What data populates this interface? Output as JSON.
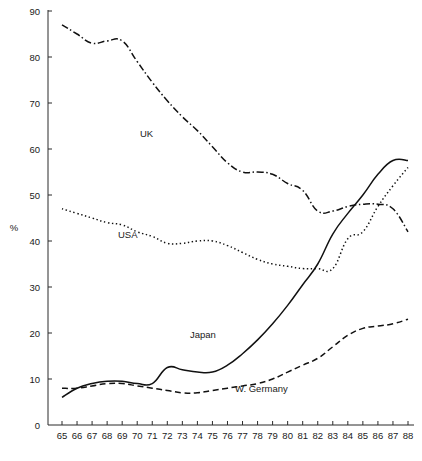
{
  "chart_data": {
    "type": "line",
    "title": "",
    "xlabel": "",
    "ylabel": "%",
    "xlim": [
      65,
      88
    ],
    "ylim": [
      0,
      90
    ],
    "grid": false,
    "legend": "inline-annotations",
    "x": [
      65,
      66,
      67,
      68,
      69,
      70,
      71,
      72,
      73,
      74,
      75,
      76,
      77,
      78,
      79,
      80,
      81,
      82,
      83,
      84,
      85,
      86,
      87,
      88
    ],
    "xticklabels": [
      "65",
      "66",
      "67",
      "68",
      "69",
      "70",
      "71",
      "72",
      "73",
      "74",
      "75",
      "76",
      "77",
      "78",
      "79",
      "80",
      "81",
      "82",
      "83",
      "84",
      "85",
      "86",
      "87",
      "88"
    ],
    "yticklabels": [
      "0",
      "10",
      "20",
      "30",
      "40",
      "50",
      "60",
      "70",
      "80",
      "90"
    ],
    "yticks": [
      0,
      10,
      20,
      30,
      40,
      50,
      60,
      70,
      80,
      90
    ],
    "series": [
      {
        "name": "UK",
        "style": "dash-dot",
        "label": "UK",
        "values": [
          87,
          85,
          83,
          83.5,
          83.5,
          79,
          74.5,
          70.5,
          67,
          64,
          60.5,
          57,
          55,
          55,
          54.5,
          52.5,
          51,
          46.5,
          46.5,
          47.5,
          48,
          48,
          47,
          42
        ]
      },
      {
        "name": "USA",
        "style": "dotted",
        "label": "USA",
        "values": [
          47,
          46,
          45,
          44,
          43.5,
          42,
          41,
          39.5,
          39.5,
          40,
          40,
          39,
          37.5,
          36,
          35,
          34.5,
          34,
          34,
          34,
          40.5,
          42,
          47.5,
          52,
          56
        ]
      },
      {
        "name": "Japan",
        "style": "solid",
        "label": "Japan",
        "values": [
          6,
          8,
          9,
          9.5,
          9.5,
          9,
          9,
          12.5,
          12,
          11.5,
          11.5,
          13,
          15.5,
          18.5,
          22,
          26,
          30.5,
          35,
          41.5,
          46,
          50,
          54.5,
          57.5,
          57.5
        ]
      },
      {
        "name": "W. Germany",
        "style": "dashed",
        "label": "W. Germany",
        "values": [
          8,
          8,
          8.5,
          9,
          9,
          8.5,
          8,
          7.5,
          7,
          7,
          7.5,
          8,
          8.5,
          9,
          10,
          11.5,
          13,
          14.5,
          17,
          19.5,
          21,
          21.5,
          22,
          23
        ]
      }
    ]
  },
  "axis": {
    "y_axis_title": "%"
  }
}
